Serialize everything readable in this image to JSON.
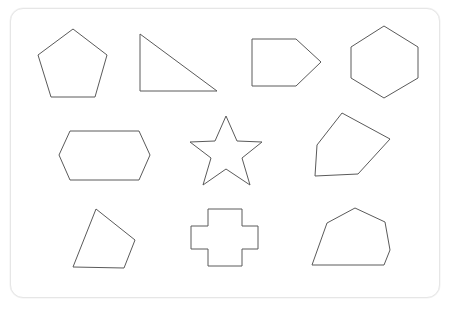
{
  "canvas": {
    "width": 452,
    "height": 319,
    "background_color": "#ffffff"
  },
  "card": {
    "background_color": "#ffffff",
    "border_color": "#e6e6e6",
    "corner_radius": 13,
    "x": 10,
    "y": 8,
    "width": 430,
    "height": 290
  },
  "style": {
    "stroke_color": "#5a5a5a",
    "stroke_width": 1,
    "fill": "none"
  },
  "shapes": [
    {
      "name": "pentagon",
      "row": 1,
      "column": 1,
      "sides": 5,
      "points": "73,29 107,55 95,97 51,97 38,55"
    },
    {
      "name": "right-triangle",
      "row": 1,
      "column": 2,
      "sides": 3,
      "points": "140,34 217,91 140,91"
    },
    {
      "name": "arrow-pentagon",
      "row": 1,
      "column": 3,
      "sides": 5,
      "points": "252,39 296,39 321,62 296,86 252,86"
    },
    {
      "name": "hexagon",
      "row": 1,
      "column": 4,
      "sides": 6,
      "points": "384,26 418,47 418,78 384,98 351,78 351,47"
    },
    {
      "name": "elongated-hexagon",
      "row": 2,
      "column": 1,
      "sides": 6,
      "points": "70,131 139,131 150,155 139,180 70,180 59,155"
    },
    {
      "name": "five-point-star",
      "row": 2,
      "column": 2,
      "sides": 10,
      "points": "226,116 237,141 262,142 242,158 250,185 226,169 203,185 211,158 190,142 215,141"
    },
    {
      "name": "irregular-pentagon-kite",
      "row": 2,
      "column": 3,
      "sides": 5,
      "points": "342,113 390,139 358,174 315,176 317,145"
    },
    {
      "name": "irregular-quadrilateral",
      "row": 3,
      "column": 1,
      "sides": 4,
      "points": "96,209 135,240 124,268 73,267"
    },
    {
      "name": "cross",
      "row": 3,
      "column": 2,
      "sides": 12,
      "points": "208,209 242,209 242,226 258,226 258,249 242,249 242,266 208,266 208,249 191,249 191,226 208,226"
    },
    {
      "name": "irregular-hexagon",
      "row": 3,
      "column": 3,
      "sides": 6,
      "points": "355,208 385,222 390,250 384,265 312,265 327,223"
    }
  ]
}
